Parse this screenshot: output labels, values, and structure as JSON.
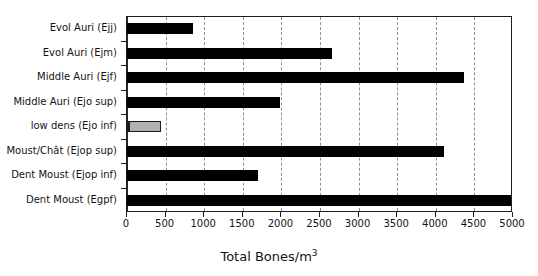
{
  "chart_data": {
    "type": "bar",
    "orientation": "horizontal",
    "title": "",
    "xlabel": "Total Bones/m³",
    "ylabel": "",
    "xlim": [
      0,
      5000
    ],
    "xticks": [
      0,
      500,
      1000,
      1500,
      2000,
      2500,
      3000,
      3500,
      4000,
      4500,
      5000
    ],
    "xtick_labels": [
      "0",
      "500",
      "1000",
      "1500",
      "2000",
      "2500",
      "3000",
      "3500",
      "4000",
      "4500",
      "5000"
    ],
    "grid": true,
    "grid_axis": "x",
    "grid_style": "dashed",
    "legend": false,
    "categories": [
      "Evol Auri (Ejj)",
      "Evol Auri (Ejm)",
      "Middle Auri (Ejf)",
      "Middle Auri (Ejo sup)",
      "low dens (Ejo inf)",
      "Moust/Chât (Ejop sup)",
      "Dent Moust (Ejop inf)",
      "Dent Moust (Egpf)"
    ],
    "values": [
      850,
      2660,
      4360,
      1980,
      440,
      4100,
      1700,
      5000
    ],
    "bar_colors": [
      "#000000",
      "#000000",
      "#000000",
      "#000000",
      "#b0b0b0",
      "#000000",
      "#000000",
      "#000000"
    ],
    "highlight_index": 4,
    "highlight_note": "low dens (Ejo inf) bar drawn in grey with dark outline; all others solid black"
  },
  "axis_title_parts": {
    "base": "Total Bones/m",
    "exponent": "3"
  }
}
